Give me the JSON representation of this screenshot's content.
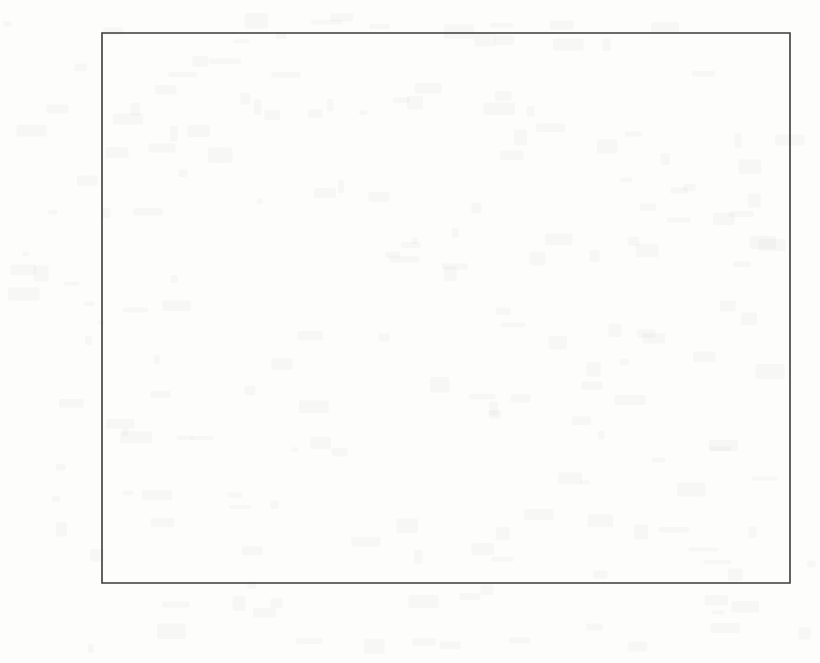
{
  "chart_data": {
    "type": "line",
    "title": "",
    "xlabel": "Time Index (Hour)",
    "ylabel": "Contact Frequency",
    "xlim": [
      0,
      24
    ],
    "ylim": [
      0,
      180
    ],
    "xticks": [
      0,
      5,
      10,
      15,
      20
    ],
    "xticklabels": [
      "0",
      "5",
      "10",
      "15",
      "20"
    ],
    "xtick_minor_step": 1,
    "yticks": [
      0,
      20,
      40,
      60,
      80,
      100,
      120,
      140,
      160,
      180
    ],
    "yticklabels": [
      "0",
      "20",
      "40",
      "60",
      "80",
      "100",
      "120",
      "140",
      "160",
      "180"
    ],
    "grid": false,
    "legend_position": "upper left",
    "x": [
      0,
      1,
      2,
      3,
      4,
      5,
      6,
      7,
      8,
      9,
      10,
      11,
      12,
      13,
      14,
      15,
      16,
      17,
      18,
      19,
      20,
      21,
      22,
      23,
      24
    ],
    "series": [
      {
        "name": "Affiliation Community",
        "marker": "plus",
        "color": "#4a4a4a",
        "values": [
          1,
          1,
          1,
          0,
          0,
          0,
          0,
          0,
          1,
          5,
          24,
          61,
          46,
          92,
          140,
          146,
          153,
          111,
          92,
          72,
          46,
          16,
          7,
          3,
          0
        ]
      },
      {
        "name": "Gaussian Distribution",
        "marker": "none",
        "color": "#4a4a4a",
        "values": [
          0,
          0,
          0,
          1,
          1,
          2,
          4,
          8,
          16,
          30,
          51,
          78,
          108,
          133,
          147,
          149,
          141,
          124,
          100,
          74,
          49,
          29,
          15,
          6,
          1
        ]
      }
    ]
  },
  "legend": {
    "entries": [
      {
        "label": "Affiliation Community"
      },
      {
        "label": "Gaussian Distribution"
      }
    ]
  },
  "axes": {
    "x_title": "Time Index (Hour)",
    "y_title": "Contact Frequency"
  },
  "colors": {
    "background": "#fdfdfc",
    "axis": "#3b3b3b",
    "line": "#4a4a4a",
    "text": "#1a1a1a"
  }
}
